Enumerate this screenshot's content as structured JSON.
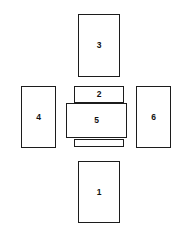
{
  "diagram": {
    "type": "box-net",
    "title": "",
    "background_color": "#ffffff",
    "stroke_color": "#1c1c1c",
    "fill_color": "#ffffff",
    "label_color": "#111111",
    "canvas": {
      "width": 188,
      "height": 232
    },
    "faces": [
      {
        "id": "face-3",
        "label": "3",
        "position": "top",
        "x": 78,
        "y": 14,
        "width": 42,
        "height": 63,
        "has_label": true
      },
      {
        "id": "face-2",
        "label": "2",
        "position": "upper-center",
        "x": 74,
        "y": 86,
        "width": 50,
        "height": 17,
        "has_label": true
      },
      {
        "id": "face-4",
        "label": "4",
        "position": "left",
        "x": 21,
        "y": 86,
        "width": 35,
        "height": 62,
        "has_label": true
      },
      {
        "id": "face-5",
        "label": "5",
        "position": "center",
        "x": 66,
        "y": 103,
        "width": 61,
        "height": 35,
        "has_label": true
      },
      {
        "id": "face-6",
        "label": "6",
        "position": "right",
        "x": 136,
        "y": 86,
        "width": 35,
        "height": 62,
        "has_label": true
      },
      {
        "id": "face-flap",
        "label": "",
        "position": "lower-center-flap",
        "x": 74,
        "y": 139,
        "width": 50,
        "height": 8,
        "has_label": false
      },
      {
        "id": "face-1",
        "label": "1",
        "position": "bottom",
        "x": 78,
        "y": 161,
        "width": 42,
        "height": 62,
        "has_label": true
      }
    ]
  }
}
